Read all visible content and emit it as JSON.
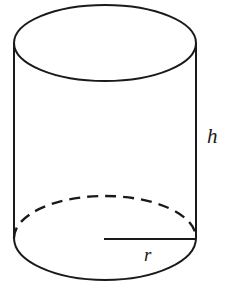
{
  "figure": {
    "kind": "solid-geometry-diagram",
    "shape_name": "right circular cylinder",
    "background_color": "#ffffff",
    "stroke_color": "#1a1a1a",
    "stroke_width": 2,
    "canvas": {
      "width": 230,
      "height": 291
    }
  },
  "labels": {
    "height": "h",
    "radius": "r"
  },
  "geometry": {
    "top_ellipse": {
      "cx": 105,
      "cy": 43,
      "rx": 91,
      "ry": 38
    },
    "bottom_ellipse": {
      "cx": 105,
      "cy": 238,
      "rx": 91,
      "ry": 42
    },
    "left_side": {
      "x1": 14,
      "y1": 43,
      "x2": 14,
      "y2": 238
    },
    "right_side": {
      "x1": 196,
      "y1": 43,
      "x2": 196,
      "y2": 238
    },
    "radius_line": {
      "x1": 104,
      "y1": 239,
      "x2": 196,
      "y2": 239
    },
    "height_label_pos": {
      "x": 207,
      "y": 143
    },
    "radius_label_pos": {
      "x": 144,
      "y": 261
    },
    "hidden_edge_style": "dashed",
    "dash_pattern": "11 7"
  }
}
